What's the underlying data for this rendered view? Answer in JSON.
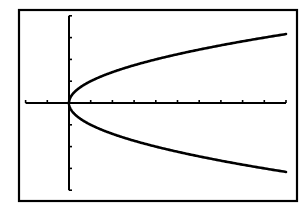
{
  "chart_data": {
    "type": "line",
    "title": "",
    "xlabel": "",
    "ylabel": "",
    "xlim": [
      -2,
      10
    ],
    "ylim": [
      -4,
      4
    ],
    "xticks": [
      -2,
      -1,
      0,
      1,
      2,
      3,
      4,
      5,
      6,
      7,
      8,
      9,
      10
    ],
    "yticks": [
      -4,
      -3,
      -2,
      -1,
      0,
      1,
      2,
      3,
      4
    ],
    "tick_labels_shown": false,
    "grid": false,
    "legend": null,
    "frame": true,
    "series": [
      {
        "name": "y = sqrt(x)",
        "equation": "y = √x",
        "x_range": [
          0,
          10
        ],
        "color": "#000000"
      },
      {
        "name": "y = -sqrt(x)",
        "equation": "y = −√x",
        "x_range": [
          0,
          10
        ],
        "color": "#000000"
      }
    ]
  },
  "colors": {
    "background": "#ffffff",
    "ink": "#000000"
  }
}
